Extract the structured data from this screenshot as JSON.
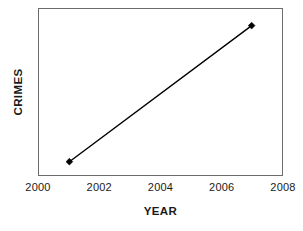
{
  "chart_data": {
    "type": "line",
    "title": "",
    "subtitle": "",
    "xlabel": "YEAR",
    "ylabel": "CRIMES",
    "x": [
      2001,
      2007
    ],
    "series": [
      {
        "name": "Crimes",
        "x": [
          2001,
          2007
        ],
        "values": [
          8,
          90
        ],
        "color": "#000000",
        "marker": "diamond",
        "line_width": 1.4
      }
    ],
    "xlim": [
      2000,
      2008
    ],
    "ylim": [
      0,
      100
    ],
    "xticks": [
      2000,
      2002,
      2004,
      2006,
      2008
    ],
    "xtick_labels": [
      "2000",
      "2002",
      "2004",
      "2006",
      "2008"
    ],
    "yticks": [],
    "ytick_labels": [],
    "grid": false,
    "legend": false,
    "legend_position": "none",
    "annotations": [],
    "frame_color": "#6b6b6b",
    "background_color": "#ffffff"
  }
}
